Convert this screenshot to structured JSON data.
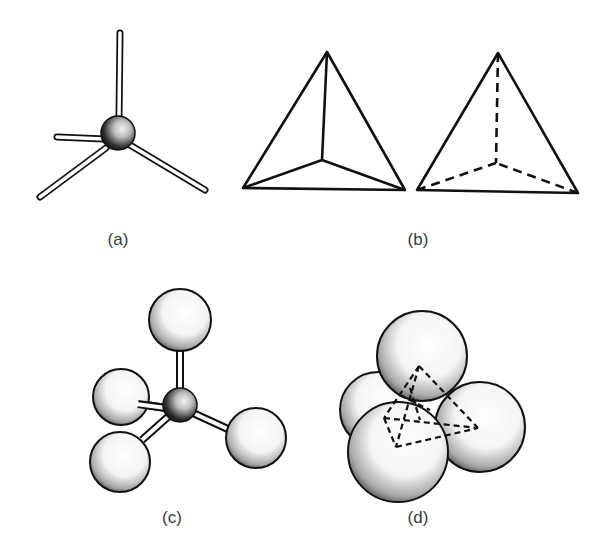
{
  "figure": {
    "panels": [
      {
        "id": "a",
        "label": "(a)",
        "description": "Tetrahedral bonding: central atom with four rods"
      },
      {
        "id": "b",
        "label": "(b)",
        "description": "Tetrahedron outlines, solid and dashed hidden edges"
      },
      {
        "id": "c",
        "label": "(c)",
        "description": "Ball-and-stick model, central atom with four spheres"
      },
      {
        "id": "d",
        "label": "(d)",
        "description": "Space-filling model with inscribed dashed tetrahedron"
      }
    ]
  },
  "colors": {
    "stroke": "#111111",
    "background": "#ffffff",
    "label": "#3a3a3a"
  }
}
